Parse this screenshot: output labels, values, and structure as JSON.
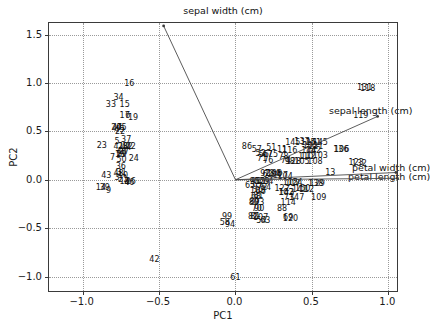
{
  "chart_data": {
    "type": "scatter",
    "title": "",
    "xlabel": "PC1",
    "ylabel": "PC2",
    "xlim": [
      -1.22,
      1.07
    ],
    "ylim": [
      -1.17,
      1.62
    ],
    "xticks": [
      -1.0,
      -0.5,
      0.0,
      0.5,
      1.0
    ],
    "xticklabels": [
      "-1.0",
      "-0.5",
      "0.0",
      "0.5",
      "1.0"
    ],
    "yticks": [
      -1.0,
      -0.5,
      0.0,
      0.5,
      1.0,
      1.5
    ],
    "yticklabels": [
      "-1.0",
      "-0.5",
      "0.0",
      "0.5",
      "1.0",
      "1.5"
    ],
    "grid": true,
    "legend": "none",
    "marker": "text-label",
    "vectors": [
      {
        "name": "sepal width (cm)",
        "x": -0.47,
        "y": 1.59,
        "label_x": 0.0,
        "label_y": 1.72
      },
      {
        "name": "sepal length (cm)",
        "x": 0.93,
        "y": 0.655,
        "label_x": 0.84,
        "label_y": 0.655
      },
      {
        "name": "petal width (cm)",
        "x": 1.05,
        "y": 0.075,
        "label_x": 0.99,
        "label_y": 0.06
      },
      {
        "name": "petal length (cm)",
        "x": 1.06,
        "y": 0.015,
        "label_x": 0.97,
        "label_y": -0.005
      }
    ],
    "points": [
      {
        "label": "16",
        "x": -0.695,
        "y": 0.985
      },
      {
        "label": "34",
        "x": -0.765,
        "y": 0.845
      },
      {
        "label": "33",
        "x": -0.815,
        "y": 0.775
      },
      {
        "label": "15",
        "x": -0.725,
        "y": 0.77
      },
      {
        "label": "17",
        "x": -0.725,
        "y": 0.66
      },
      {
        "label": "6",
        "x": -0.705,
        "y": 0.655
      },
      {
        "label": "19",
        "x": -0.67,
        "y": 0.635
      },
      {
        "label": "20",
        "x": -0.78,
        "y": 0.535
      },
      {
        "label": "47",
        "x": -0.775,
        "y": 0.54
      },
      {
        "label": "45",
        "x": -0.745,
        "y": 0.535
      },
      {
        "label": "22",
        "x": -0.755,
        "y": 0.495
      },
      {
        "label": "49",
        "x": -0.76,
        "y": 0.512
      },
      {
        "label": "5",
        "x": -0.775,
        "y": 0.395
      },
      {
        "label": "37",
        "x": -0.715,
        "y": 0.41
      },
      {
        "label": "23",
        "x": -0.875,
        "y": 0.345
      },
      {
        "label": "41",
        "x": -0.765,
        "y": 0.34
      },
      {
        "label": "28",
        "x": -0.735,
        "y": 0.34
      },
      {
        "label": "44",
        "x": -0.715,
        "y": 0.33
      },
      {
        "label": "32",
        "x": -0.705,
        "y": 0.335
      },
      {
        "label": "12",
        "x": -0.685,
        "y": 0.335
      },
      {
        "label": "27",
        "x": -0.73,
        "y": 0.285
      },
      {
        "label": "40",
        "x": -0.745,
        "y": 0.29
      },
      {
        "label": "1",
        "x": -0.765,
        "y": 0.26
      },
      {
        "label": "18",
        "x": -0.755,
        "y": 0.26
      },
      {
        "label": "29",
        "x": -0.745,
        "y": 0.255
      },
      {
        "label": "7",
        "x": -0.805,
        "y": 0.225
      },
      {
        "label": "50",
        "x": -0.745,
        "y": 0.205
      },
      {
        "label": "24",
        "x": -0.665,
        "y": 0.215
      },
      {
        "label": "36",
        "x": -0.75,
        "y": 0.13
      },
      {
        "label": "48",
        "x": -0.765,
        "y": 0.055
      },
      {
        "label": "31",
        "x": -0.745,
        "y": 0.07
      },
      {
        "label": "10",
        "x": -0.735,
        "y": 0.035
      },
      {
        "label": "43",
        "x": -0.845,
        "y": 0.035
      },
      {
        "label": "3",
        "x": -0.775,
        "y": 0.02
      },
      {
        "label": "21",
        "x": -0.735,
        "y": 0.0
      },
      {
        "label": "13",
        "x": -0.725,
        "y": -0.025
      },
      {
        "label": "4",
        "x": -0.71,
        "y": -0.03
      },
      {
        "label": "26",
        "x": -0.685,
        "y": -0.025
      },
      {
        "label": "46",
        "x": -0.695,
        "y": -0.03
      },
      {
        "label": "14",
        "x": -0.88,
        "y": -0.08
      },
      {
        "label": "39",
        "x": -0.855,
        "y": -0.085
      },
      {
        "label": "9",
        "x": -0.83,
        "y": -0.115
      },
      {
        "label": "42",
        "x": -0.53,
        "y": -0.83
      },
      {
        "label": "86",
        "x": 0.075,
        "y": 0.34
      },
      {
        "label": "57",
        "x": 0.14,
        "y": 0.305
      },
      {
        "label": "51",
        "x": 0.235,
        "y": 0.325
      },
      {
        "label": "145",
        "x": 0.375,
        "y": 0.385
      },
      {
        "label": "137",
        "x": 0.435,
        "y": 0.395
      },
      {
        "label": "125",
        "x": 0.475,
        "y": 0.385
      },
      {
        "label": "141",
        "x": 0.51,
        "y": 0.385
      },
      {
        "label": "145",
        "x": 0.555,
        "y": 0.385
      },
      {
        "label": "101",
        "x": 0.49,
        "y": 0.345
      },
      {
        "label": "121",
        "x": 0.525,
        "y": 0.335
      },
      {
        "label": "11",
        "x": 0.305,
        "y": 0.305
      },
      {
        "label": "116",
        "x": 0.355,
        "y": 0.295
      },
      {
        "label": "144",
        "x": 0.48,
        "y": 0.3
      },
      {
        "label": "142",
        "x": 0.51,
        "y": 0.3
      },
      {
        "label": "52",
        "x": 0.165,
        "y": 0.265
      },
      {
        "label": "56",
        "x": 0.185,
        "y": 0.255
      },
      {
        "label": "67",
        "x": 0.21,
        "y": 0.255
      },
      {
        "label": "75",
        "x": 0.245,
        "y": 0.255
      },
      {
        "label": "78",
        "x": 0.315,
        "y": 0.24
      },
      {
        "label": "110",
        "x": 0.46,
        "y": 0.24
      },
      {
        "label": "112",
        "x": 0.475,
        "y": 0.24
      },
      {
        "label": "103",
        "x": 0.555,
        "y": 0.245
      },
      {
        "label": "71",
        "x": 0.175,
        "y": 0.215
      },
      {
        "label": "76",
        "x": 0.215,
        "y": 0.195
      },
      {
        "label": "74",
        "x": 0.33,
        "y": 0.19
      },
      {
        "label": "98",
        "x": 0.355,
        "y": 0.185
      },
      {
        "label": "128",
        "x": 0.38,
        "y": 0.185
      },
      {
        "label": "105",
        "x": 0.435,
        "y": 0.185
      },
      {
        "label": "108",
        "x": 0.52,
        "y": 0.185
      },
      {
        "label": "136",
        "x": 0.69,
        "y": 0.31
      },
      {
        "label": "106",
        "x": 0.695,
        "y": 0.31
      },
      {
        "label": "131",
        "x": 0.845,
        "y": 0.945
      },
      {
        "label": "118",
        "x": 0.865,
        "y": 0.935
      },
      {
        "label": "119",
        "x": 0.82,
        "y": 0.655
      },
      {
        "label": "123",
        "x": 0.79,
        "y": 0.17
      },
      {
        "label": "132",
        "x": 0.81,
        "y": 0.16
      },
      {
        "label": "13",
        "x": 0.62,
        "y": 0.065
      },
      {
        "label": "92",
        "x": 0.195,
        "y": 0.055
      },
      {
        "label": "62",
        "x": 0.21,
        "y": 0.05
      },
      {
        "label": "134",
        "x": 0.24,
        "y": 0.055
      },
      {
        "label": "100",
        "x": 0.255,
        "y": 0.055
      },
      {
        "label": "84",
        "x": 0.265,
        "y": 0.05
      },
      {
        "label": "127",
        "x": 0.295,
        "y": 0.035
      },
      {
        "label": "104",
        "x": 0.325,
        "y": 0.03
      },
      {
        "label": "95",
        "x": 0.125,
        "y": -0.025
      },
      {
        "label": "96",
        "x": 0.135,
        "y": -0.02
      },
      {
        "label": "55",
        "x": 0.16,
        "y": -0.025
      },
      {
        "label": "79",
        "x": 0.19,
        "y": -0.02
      },
      {
        "label": "64",
        "x": 0.215,
        "y": -0.02
      },
      {
        "label": "115",
        "x": 0.36,
        "y": -0.035
      },
      {
        "label": "117",
        "x": 0.375,
        "y": -0.04
      },
      {
        "label": "124",
        "x": 0.39,
        "y": -0.035
      },
      {
        "label": "138",
        "x": 0.525,
        "y": -0.045
      },
      {
        "label": "129",
        "x": 0.535,
        "y": -0.045
      },
      {
        "label": "65",
        "x": 0.095,
        "y": -0.065
      },
      {
        "label": "97",
        "x": 0.145,
        "y": -0.075
      },
      {
        "label": "72",
        "x": 0.175,
        "y": -0.085
      },
      {
        "label": "54",
        "x": 0.2,
        "y": -0.085
      },
      {
        "label": "122",
        "x": 0.305,
        "y": -0.1
      },
      {
        "label": "141",
        "x": 0.42,
        "y": -0.105
      },
      {
        "label": "150",
        "x": 0.44,
        "y": -0.1
      },
      {
        "label": "112",
        "x": 0.465,
        "y": -0.105
      },
      {
        "label": "105",
        "x": 0.145,
        "y": -0.12
      },
      {
        "label": "66",
        "x": 0.165,
        "y": -0.125
      },
      {
        "label": "102",
        "x": 0.33,
        "y": -0.135
      },
      {
        "label": "143",
        "x": 0.335,
        "y": -0.14
      },
      {
        "label": "68",
        "x": 0.135,
        "y": -0.175
      },
      {
        "label": "81",
        "x": 0.15,
        "y": -0.17
      },
      {
        "label": "73",
        "x": 0.35,
        "y": -0.185
      },
      {
        "label": "147",
        "x": 0.4,
        "y": -0.185
      },
      {
        "label": "109",
        "x": 0.545,
        "y": -0.185
      },
      {
        "label": "80",
        "x": 0.12,
        "y": -0.235
      },
      {
        "label": "89",
        "x": 0.125,
        "y": -0.23
      },
      {
        "label": "93",
        "x": 0.155,
        "y": -0.24
      },
      {
        "label": "114",
        "x": 0.345,
        "y": -0.245
      },
      {
        "label": "70",
        "x": 0.14,
        "y": -0.305
      },
      {
        "label": "90",
        "x": 0.155,
        "y": -0.305
      },
      {
        "label": "88",
        "x": 0.305,
        "y": -0.305
      },
      {
        "label": "99",
        "x": -0.055,
        "y": -0.385
      },
      {
        "label": "82",
        "x": 0.115,
        "y": -0.385
      },
      {
        "label": "81",
        "x": 0.13,
        "y": -0.385
      },
      {
        "label": "107",
        "x": 0.165,
        "y": -0.39
      },
      {
        "label": "69",
        "x": 0.345,
        "y": -0.395
      },
      {
        "label": "120",
        "x": 0.36,
        "y": -0.405
      },
      {
        "label": "54",
        "x": 0.17,
        "y": -0.425
      },
      {
        "label": "63",
        "x": 0.195,
        "y": -0.425
      },
      {
        "label": "58",
        "x": -0.07,
        "y": -0.445
      },
      {
        "label": "94",
        "x": -0.035,
        "y": -0.47
      },
      {
        "label": "61",
        "x": 0.0,
        "y": -1.015
      }
    ]
  },
  "footer": {
    "note": ""
  }
}
